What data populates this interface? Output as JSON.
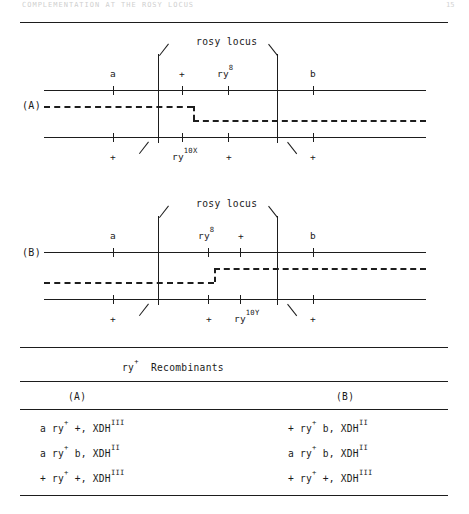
{
  "runhead": {
    "left_text": "COMPLEMENTATION AT THE ROSY LOCUS",
    "folio": "15"
  },
  "figure": {
    "panels": [
      {
        "id": "(A)",
        "locus_label": "rosy locus",
        "top_labels": [
          "a",
          "+",
          "ry8",
          "b"
        ],
        "top_labels_display": [
          "a",
          "+",
          "ry",
          "b"
        ],
        "top_superscripts": [
          "",
          "",
          "8",
          ""
        ],
        "bottom_labels_display": [
          "+",
          "ry",
          "+",
          "+"
        ],
        "bottom_superscripts": [
          "",
          "10X",
          "",
          ""
        ],
        "dashed_step": "down"
      },
      {
        "id": "(B)",
        "locus_label": "rosy locus",
        "top_labels_display": [
          "a",
          "ry",
          "+",
          "b"
        ],
        "top_superscripts": [
          "",
          "8",
          "",
          ""
        ],
        "bottom_labels_display": [
          "+",
          "+",
          "ry",
          "+"
        ],
        "bottom_superscripts": [
          "",
          "",
          "10Y",
          ""
        ],
        "dashed_step": "up"
      }
    ]
  },
  "table": {
    "title_main": "Recombinants",
    "title_gene": "ry",
    "title_gene_sup": "+",
    "columns": [
      "(A)",
      "(B)"
    ],
    "rows_a": [
      {
        "genotype": "a ry",
        "sup1": "+",
        "rest": " +, XDH",
        "sup2": "III"
      },
      {
        "genotype": "a ry",
        "sup1": "+",
        "rest": " b, XDH",
        "sup2": "II"
      },
      {
        "genotype": "+ ry",
        "sup1": "+",
        "rest": " +, XDH",
        "sup2": "III"
      }
    ],
    "rows_b": [
      {
        "genotype": "+ ry",
        "sup1": "+",
        "rest": " b, XDH",
        "sup2": "II"
      },
      {
        "genotype": "a ry",
        "sup1": "+",
        "rest": " b, XDH",
        "sup2": "II"
      },
      {
        "genotype": "+ ry",
        "sup1": "+",
        "rest": " +, XDH",
        "sup2": "III"
      }
    ]
  },
  "colors": {
    "ink": "#1d1d1d",
    "paper": "#ffffff"
  }
}
